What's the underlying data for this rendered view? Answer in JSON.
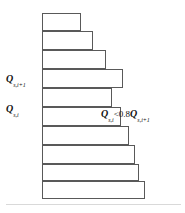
{
  "figure": {
    "background_color": "#ffffff",
    "width": 185,
    "height": 213
  },
  "wall": {
    "name": "vertical-wall",
    "color": "#0a0a0a",
    "x": 42,
    "y": 13,
    "width": 3,
    "height": 186
  },
  "baseline": {
    "color": "#d9d9d9",
    "y": 204
  },
  "bar_style": {
    "fill": "#ffffff",
    "stroke": "#595959",
    "stroke_width": 1
  },
  "chart_data": {
    "type": "bar",
    "orientation": "horizontal",
    "title": "",
    "xlabel": "",
    "ylabel": "",
    "grid": false,
    "legend": false,
    "note": "Bar lengths increase downward except at index i where the bar is shorter than the bar above it",
    "categories": [
      "1",
      "2",
      "3",
      "4",
      "5",
      "6",
      "7",
      "8",
      "9",
      "10"
    ],
    "values": [
      39,
      51,
      64,
      81,
      70,
      79,
      87,
      93,
      97,
      103
    ],
    "bars": [
      {
        "index": 1,
        "x": 42,
        "y": 13,
        "width": 39,
        "height": 18
      },
      {
        "index": 2,
        "x": 42,
        "y": 31,
        "width": 51,
        "height": 19
      },
      {
        "index": 3,
        "x": 42,
        "y": 50,
        "width": 64,
        "height": 19
      },
      {
        "index": 4,
        "x": 42,
        "y": 69,
        "width": 81,
        "height": 19
      },
      {
        "index": 5,
        "x": 42,
        "y": 88,
        "width": 70,
        "height": 19
      },
      {
        "index": 6,
        "x": 42,
        "y": 107,
        "width": 79,
        "height": 19
      },
      {
        "index": 7,
        "x": 42,
        "y": 126,
        "width": 87,
        "height": 19
      },
      {
        "index": 8,
        "x": 42,
        "y": 145,
        "width": 93,
        "height": 19
      },
      {
        "index": 9,
        "x": 42,
        "y": 164,
        "width": 97,
        "height": 17
      },
      {
        "index": 10,
        "x": 42,
        "y": 181,
        "width": 103,
        "height": 18
      }
    ]
  },
  "labels": {
    "left_upper": {
      "name": "label-q-s-i-plus-1",
      "variable": "Q",
      "subscript": "s,i+1"
    },
    "left_lower": {
      "name": "label-q-s-i",
      "variable": "Q",
      "subscript": "s,i"
    },
    "inequality": {
      "name": "label-inequality",
      "left_variable": "Q",
      "left_subscript": "s,i",
      "operator": "<",
      "coefficient": "0.8",
      "right_variable": "Q",
      "right_subscript": "s,i+1",
      "plain_text": "Q s,i < 0.8 Q s,i+1"
    }
  }
}
